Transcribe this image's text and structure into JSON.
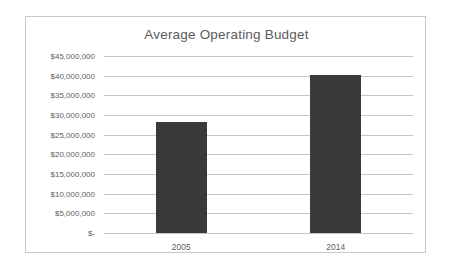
{
  "chart_data": {
    "type": "bar",
    "title": "Average Operating Budget",
    "xlabel": "",
    "ylabel": "",
    "categories": [
      "2005",
      "2014"
    ],
    "values": [
      28300000,
      40200000
    ],
    "ylim": [
      0,
      45000000
    ],
    "ytick_values": [
      45000000,
      40000000,
      35000000,
      30000000,
      25000000,
      20000000,
      15000000,
      10000000,
      5000000,
      0
    ],
    "ytick_labels": [
      "$45,000,000",
      "$40,000,000",
      "$35,000,000",
      "$30,000,000",
      "$25,000,000",
      "$20,000,000",
      "$15,000,000",
      "$10,000,000",
      "$5,000,000",
      "$-"
    ],
    "grid": true,
    "legend": false,
    "legend_position": "none",
    "bar_color": "#3a3a3a",
    "gridline_color": "#c5c5c5",
    "title_color": "#5b5b5b",
    "tick_label_color": "#5e5e5e",
    "frame_color": "#c8c8c8",
    "background_color": "#ffffff"
  }
}
